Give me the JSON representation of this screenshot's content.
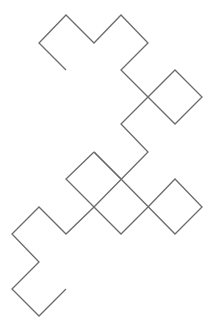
{
  "diagram": {
    "type": "dragon-curve-fractal",
    "background": "#ffffff",
    "stroke_color": "#6b6b6b",
    "stroke_width": 1.3,
    "paths": [
      [
        [
          66,
          70
        ],
        [
          39,
          43
        ],
        [
          66,
          15
        ],
        [
          94,
          43
        ],
        [
          121,
          15
        ],
        [
          148,
          43
        ],
        [
          121,
          70
        ],
        [
          148,
          97
        ],
        [
          175,
          70
        ],
        [
          202,
          97
        ],
        [
          175,
          124
        ],
        [
          148,
          97
        ],
        [
          121,
          124
        ],
        [
          148,
          152
        ],
        [
          94,
          207
        ],
        [
          66,
          234
        ],
        [
          39,
          207
        ],
        [
          12,
          234
        ],
        [
          39,
          262
        ],
        [
          12,
          289
        ],
        [
          39,
          316
        ],
        [
          66,
          289
        ]
      ],
      [
        [
          94,
          152
        ],
        [
          66,
          179
        ],
        [
          121,
          234
        ],
        [
          148,
          207
        ],
        [
          175,
          179
        ],
        [
          202,
          207
        ],
        [
          175,
          234
        ],
        [
          121,
          179
        ],
        [
          94,
          152
        ]
      ],
      [
        [
          94,
          152
        ],
        [
          121,
          179
        ]
      ]
    ]
  }
}
